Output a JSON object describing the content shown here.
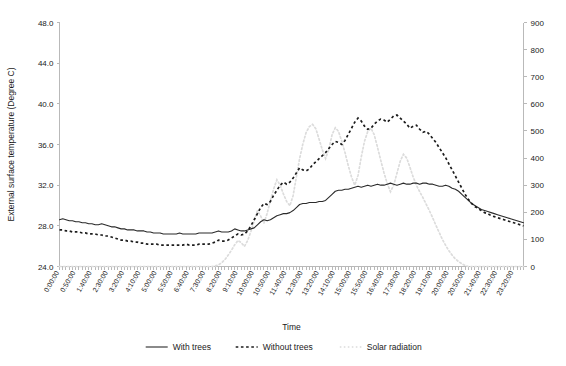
{
  "chart_data": {
    "type": "line",
    "title": "",
    "xlabel": "Time",
    "ylabel": "External surface temperature (Degree C)",
    "ylabel_right": "",
    "ylim": [
      24.0,
      48.0
    ],
    "ylim_right": [
      0,
      900
    ],
    "grid": false,
    "legend_position": "bottom",
    "y_ticks": [
      "24.0",
      "28.0",
      "32.0",
      "36.0",
      "40.0",
      "44.0",
      "48.0"
    ],
    "y_ticks_right": [
      "0",
      "100",
      "200",
      "300",
      "400",
      "500",
      "600",
      "700",
      "800",
      "900"
    ],
    "x_tick_labels": [
      "0:00:00",
      "0:50:00",
      "1:40:00",
      "2:30:00",
      "3:20:00",
      "4:10:00",
      "5:00:00",
      "5:50:00",
      "6:40:00",
      "7:30:00",
      "8:20:00",
      "9:10:00",
      "10:00:00",
      "10:50:00",
      "11:40:00",
      "12:30:00",
      "13:20:00",
      "14:10:00",
      "15:00:00",
      "15:50:00",
      "16:40:00",
      "17:30:00",
      "18:20:00",
      "19:10:00",
      "20:00:00",
      "20:50:00",
      "21:40:00",
      "22:30:00",
      "23:20:00"
    ],
    "x_interval_minutes": 10,
    "x_points": 144,
    "series": [
      {
        "name": "With trees",
        "axis": "left",
        "units": "Degree C",
        "style": "solid",
        "color": "#2b2b2b",
        "values": [
          28.6,
          28.7,
          28.6,
          28.5,
          28.5,
          28.4,
          28.4,
          28.3,
          28.3,
          28.2,
          28.2,
          28.1,
          28.1,
          28.2,
          28.1,
          28.0,
          27.9,
          27.9,
          27.8,
          27.7,
          27.7,
          27.6,
          27.6,
          27.6,
          27.5,
          27.5,
          27.5,
          27.4,
          27.4,
          27.3,
          27.3,
          27.3,
          27.2,
          27.2,
          27.2,
          27.2,
          27.2,
          27.3,
          27.2,
          27.2,
          27.2,
          27.2,
          27.2,
          27.3,
          27.3,
          27.3,
          27.3,
          27.3,
          27.4,
          27.5,
          27.4,
          27.4,
          27.4,
          27.5,
          27.7,
          27.6,
          27.5,
          27.5,
          27.6,
          27.7,
          27.8,
          28.1,
          28.4,
          28.6,
          28.5,
          28.6,
          28.8,
          29.0,
          29.1,
          29.2,
          29.2,
          29.3,
          29.5,
          29.8,
          30.1,
          30.2,
          30.2,
          30.3,
          30.3,
          30.3,
          30.4,
          30.4,
          30.5,
          30.8,
          31.1,
          31.4,
          31.5,
          31.5,
          31.6,
          31.6,
          31.7,
          31.8,
          31.9,
          31.8,
          31.9,
          32.0,
          31.9,
          32.0,
          32.1,
          32.0,
          32.0,
          32.1,
          32.2,
          32.1,
          32.0,
          32.1,
          32.2,
          32.1,
          32.1,
          32.2,
          32.2,
          32.1,
          32.2,
          32.2,
          32.1,
          32.1,
          32.0,
          31.9,
          31.9,
          32.0,
          31.9,
          31.7,
          31.6,
          31.4,
          31.1,
          30.8,
          30.5,
          30.2,
          30.0,
          29.8,
          29.6,
          29.5,
          29.4,
          29.3,
          29.2,
          29.1,
          29.0,
          28.9,
          28.8,
          28.7,
          28.6,
          28.5,
          28.4,
          28.3
        ]
      },
      {
        "name": "Without trees",
        "axis": "left",
        "units": "Degree C",
        "style": "dashed",
        "color": "#1c1c1c",
        "values": [
          27.6,
          27.6,
          27.5,
          27.5,
          27.4,
          27.4,
          27.4,
          27.3,
          27.3,
          27.2,
          27.2,
          27.2,
          27.1,
          27.1,
          27.0,
          27.0,
          26.9,
          26.8,
          26.7,
          26.6,
          26.6,
          26.5,
          26.5,
          26.4,
          26.4,
          26.3,
          26.3,
          26.2,
          26.2,
          26.2,
          26.2,
          26.1,
          26.1,
          26.1,
          26.1,
          26.1,
          26.1,
          26.1,
          26.1,
          26.2,
          26.1,
          26.1,
          26.1,
          26.2,
          26.2,
          26.2,
          26.2,
          26.3,
          26.4,
          26.6,
          26.5,
          26.5,
          26.6,
          26.8,
          27.0,
          27.2,
          27.1,
          27.2,
          27.5,
          28.0,
          28.6,
          29.2,
          29.8,
          30.2,
          30.1,
          30.4,
          31.0,
          31.5,
          32.0,
          32.3,
          32.1,
          32.3,
          32.7,
          33.2,
          33.7,
          33.5,
          33.4,
          33.6,
          34.0,
          34.3,
          34.6,
          34.9,
          35.2,
          35.6,
          36.0,
          36.3,
          36.2,
          36.0,
          36.4,
          37.0,
          37.6,
          38.2,
          38.6,
          38.3,
          37.8,
          37.5,
          37.6,
          38.0,
          38.3,
          38.5,
          38.4,
          38.2,
          38.5,
          38.8,
          38.9,
          38.6,
          38.3,
          38.0,
          37.6,
          37.8,
          37.9,
          37.5,
          37.2,
          37.3,
          37.0,
          36.6,
          36.2,
          35.7,
          35.2,
          34.7,
          34.1,
          33.5,
          32.9,
          32.3,
          31.7,
          31.1,
          30.6,
          30.2,
          29.9,
          29.7,
          29.5,
          29.3,
          29.2,
          29.0,
          28.9,
          28.8,
          28.7,
          28.6,
          28.5,
          28.4,
          28.3,
          28.2,
          28.1,
          28.0
        ]
      },
      {
        "name": "Solar radiation",
        "axis": "right",
        "units": "W/m2",
        "style": "dotted",
        "color": "#dcdcdc",
        "values": [
          0,
          0,
          0,
          0,
          0,
          0,
          0,
          0,
          0,
          0,
          0,
          0,
          0,
          0,
          0,
          0,
          0,
          0,
          0,
          0,
          0,
          0,
          0,
          0,
          0,
          0,
          0,
          0,
          0,
          0,
          0,
          0,
          0,
          0,
          0,
          0,
          0,
          0,
          0,
          0,
          0,
          0,
          0,
          0,
          0,
          0,
          0,
          0,
          2,
          6,
          14,
          26,
          42,
          60,
          80,
          96,
          88,
          74,
          96,
          130,
          168,
          206,
          186,
          160,
          196,
          244,
          286,
          320,
          300,
          268,
          240,
          224,
          262,
          330,
          398,
          452,
          494,
          516,
          524,
          508,
          470,
          430,
          398,
          432,
          486,
          512,
          498,
          462,
          420,
          372,
          330,
          300,
          336,
          404,
          462,
          498,
          510,
          486,
          440,
          392,
          346,
          306,
          276,
          300,
          344,
          388,
          414,
          400,
          366,
          330,
          300,
          276,
          254,
          230,
          206,
          180,
          152,
          126,
          100,
          78,
          58,
          42,
          28,
          18,
          10,
          4,
          0,
          0,
          0,
          0,
          0,
          0,
          0,
          0,
          0,
          0,
          0,
          0,
          0,
          0,
          0,
          0,
          0,
          0
        ]
      }
    ],
    "legend": [
      {
        "label": "With trees",
        "style": "solid",
        "color": "#2b2b2b"
      },
      {
        "label": "Without trees",
        "style": "dashed",
        "color": "#1c1c1c"
      },
      {
        "label": "Solar radiation",
        "style": "dotted",
        "color": "#dcdcdc"
      }
    ]
  }
}
